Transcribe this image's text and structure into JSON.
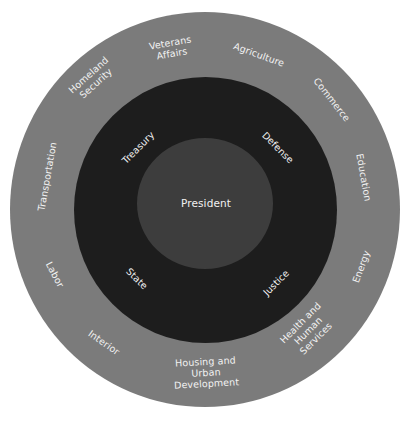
{
  "diagram": {
    "title": "",
    "center": {
      "label": "President"
    },
    "inner_ring": {
      "departments": [
        {
          "label": "Treasury"
        },
        {
          "label": "Defense"
        },
        {
          "label": "State"
        },
        {
          "label": "Justice"
        }
      ]
    },
    "outer_ring": {
      "departments": [
        {
          "label": "Veterans\nAffairs"
        },
        {
          "label": "Agriculture"
        },
        {
          "label": "Commerce"
        },
        {
          "label": "Education"
        },
        {
          "label": "Energy"
        },
        {
          "label": "Health and\nHuman\nServices"
        },
        {
          "label": "Housing and\nUrban\nDevelopment"
        },
        {
          "label": "Interior"
        },
        {
          "label": "Labor"
        },
        {
          "label": "Transportation"
        },
        {
          "label": "Homeland\nSecurity"
        }
      ]
    },
    "colors": {
      "outer_ring": "#7b7b7b",
      "inner_ring": "#1d1d1d",
      "center": "#3d3d3d",
      "text": "#f2f2f2",
      "background": "#ffffff"
    }
  }
}
